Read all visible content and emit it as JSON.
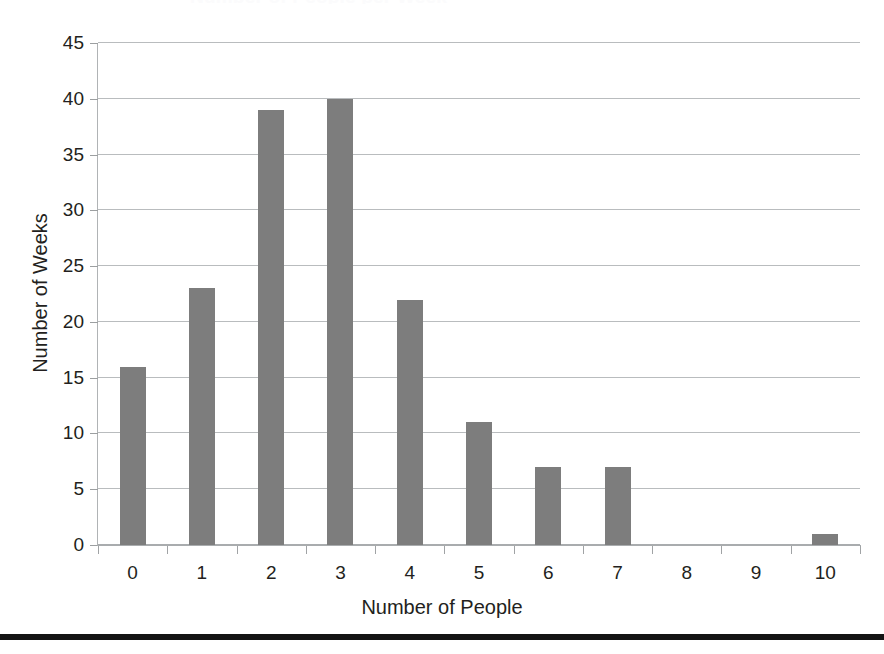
{
  "figure": {
    "title_clipped": "Number of People per Week",
    "x_axis_title": "Number of People",
    "y_axis_title": "Number of Weeks",
    "bar_color": "#7d7d7d",
    "gridline_color": "#b9bcbe",
    "axis_text_color": "#231f20",
    "bottom_rule_color": "#141414"
  },
  "chart_data": {
    "type": "bar",
    "title": "Number of People per Week",
    "xlabel": "Number of People",
    "ylabel": "Number of Weeks",
    "categories": [
      "0",
      "1",
      "2",
      "3",
      "4",
      "5",
      "6",
      "7",
      "8",
      "9",
      "10"
    ],
    "values": [
      16,
      23,
      39,
      40,
      22,
      11,
      7,
      7,
      0,
      0,
      1
    ],
    "ylim": [
      0,
      45
    ],
    "ytick_step": 5,
    "yticks": [
      "0",
      "5",
      "10",
      "15",
      "20",
      "25",
      "30",
      "35",
      "40",
      "45"
    ],
    "grid": "horizontal",
    "legend": "none",
    "series": [
      {
        "name": "Number of Weeks",
        "values": [
          16,
          23,
          39,
          40,
          22,
          11,
          7,
          7,
          0,
          0,
          1
        ]
      }
    ]
  }
}
